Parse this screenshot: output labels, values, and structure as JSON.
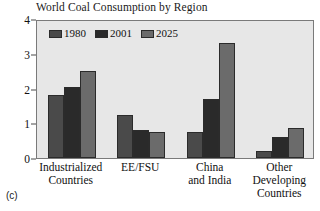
{
  "panel_tag": "(c)",
  "chart_data": {
    "type": "bar",
    "title": "World Coal Consumption by Region",
    "xlabel": "",
    "ylabel": "",
    "ylim": [
      0,
      4
    ],
    "yticks": [
      0,
      1,
      2,
      3,
      4
    ],
    "ytick_labels": [
      "0",
      "1",
      "2",
      "3",
      "4"
    ],
    "grid": false,
    "legend_position": "top-left-inside",
    "categories": [
      "Industrialized Countries",
      "EE/FSU",
      "China and India",
      "Other Developing Countries"
    ],
    "category_lines": [
      [
        "Industrialized",
        "Countries"
      ],
      [
        "EE/FSU"
      ],
      [
        "China",
        "and India"
      ],
      [
        "Other",
        "Developing",
        "Countries"
      ]
    ],
    "series": [
      {
        "name": "1980",
        "color": "#4a4a4a",
        "values": [
          1.8,
          1.25,
          0.75,
          0.2
        ]
      },
      {
        "name": "2001",
        "color": "#2a2a2a",
        "values": [
          2.05,
          0.8,
          1.7,
          0.6
        ]
      },
      {
        "name": "2025",
        "color": "#6b6b6b",
        "values": [
          2.5,
          0.75,
          3.3,
          0.85
        ]
      }
    ],
    "plot_background": "#e7e7e7",
    "axis_color": "#4a4a4a",
    "border_color": "#7a7a7a"
  }
}
